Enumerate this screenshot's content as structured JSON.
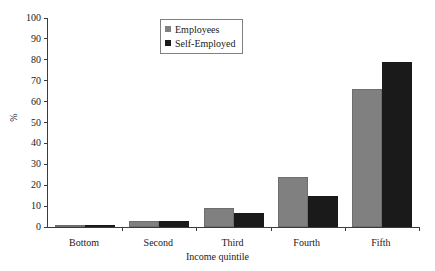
{
  "chart_data": {
    "type": "bar",
    "title": "",
    "xlabel": "Income quintile",
    "ylabel": "%",
    "categories": [
      "Bottom",
      "Second",
      "Third",
      "Fourth",
      "Fifth"
    ],
    "series": [
      {
        "name": "Employees",
        "color": "#808080",
        "values": [
          1,
          3,
          9,
          24,
          66
        ]
      },
      {
        "name": "Self-Employed",
        "color": "#1a1a1a",
        "values": [
          0.5,
          3,
          6.5,
          15,
          79
        ]
      }
    ],
    "ylim": [
      0,
      100
    ],
    "yticks": [
      0,
      10,
      20,
      30,
      40,
      50,
      60,
      70,
      80,
      90,
      100
    ],
    "ytick_labels": [
      "0",
      "10",
      "20",
      "30",
      "40",
      "50",
      "60",
      "70",
      "80",
      "90",
      "100"
    ],
    "grid": false,
    "legend_position": "top-center"
  },
  "legend": {
    "entries": [
      {
        "label": "Employees"
      },
      {
        "label": "Self-Employed"
      }
    ]
  }
}
